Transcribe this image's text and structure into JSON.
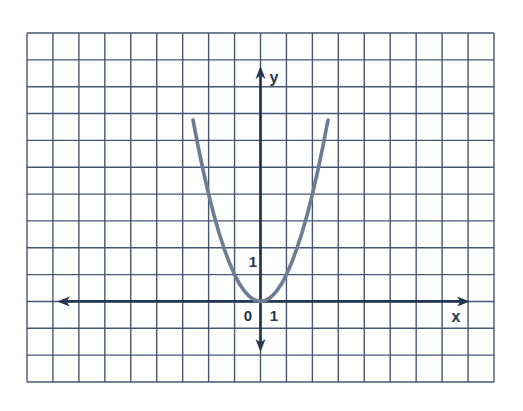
{
  "figure": {
    "background_color": "#ffffff",
    "grid": {
      "left": 27,
      "top": 33,
      "right": 494,
      "bottom": 382,
      "columns": 18,
      "rows": 13,
      "line_color": "#46566f",
      "line_width": 1.4
    },
    "axes": {
      "color": "#233750",
      "line_width": 2.7,
      "origin_col": 9,
      "origin_row": 10,
      "x_axis": {
        "tip_left": 57,
        "tip_right": 470
      },
      "y_axis": {
        "tip_top": 66,
        "tip_bottom": 352
      },
      "arrow": {
        "length": 13,
        "half_width": 5,
        "notch": 9.5
      }
    },
    "curve": {
      "color": "#6b7e94",
      "line_width": 3.7
    },
    "labels": {
      "y_axis": {
        "text": "y",
        "x": 274,
        "y": 83
      },
      "x_axis": {
        "text": "x",
        "x": 456,
        "y": 322
      },
      "origin": {
        "text": "0",
        "x": 248,
        "y": 321
      },
      "x_tick_1": {
        "text": "1",
        "x": 274,
        "y": 321
      },
      "y_tick_1": {
        "text": "1",
        "x": 253,
        "y": 267
      }
    }
  },
  "chart_data": {
    "type": "line",
    "title": "",
    "xlabel": "x",
    "ylabel": "y",
    "grid": "on",
    "units_per_cell": 1,
    "x_visible_range": [
      -9,
      9
    ],
    "y_visible_range": [
      -3,
      10
    ],
    "tick_labels": {
      "origin": "0",
      "x": [
        "1"
      ],
      "y": [
        "1"
      ]
    },
    "legend": "none",
    "series": [
      {
        "name": "y = x^2",
        "x": [
          -2.6,
          -2.4,
          -2.2,
          -2.0,
          -1.8,
          -1.6,
          -1.4,
          -1.2,
          -1.0,
          -0.8,
          -0.6,
          -0.4,
          -0.2,
          0,
          0.2,
          0.4,
          0.6,
          0.8,
          1.0,
          1.2,
          1.4,
          1.6,
          1.8,
          2.0,
          2.2,
          2.4,
          2.6
        ],
        "y": [
          6.76,
          5.76,
          4.84,
          4.0,
          3.24,
          2.56,
          1.96,
          1.44,
          1.0,
          0.64,
          0.36,
          0.16,
          0.04,
          0,
          0.04,
          0.16,
          0.36,
          0.64,
          1.0,
          1.44,
          1.96,
          2.56,
          3.24,
          4.0,
          4.84,
          5.76,
          6.76
        ]
      }
    ]
  }
}
